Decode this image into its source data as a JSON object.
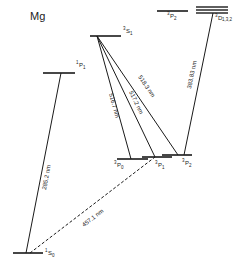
{
  "title": "Mg",
  "levels": {
    "s0_1": {
      "label": "1S0",
      "sup": "1",
      "main": "S",
      "sub": "0"
    },
    "p1_1": {
      "label": "1P1",
      "sup": "1",
      "main": "P",
      "sub": "1"
    },
    "s1_3": {
      "label": "3S1",
      "sup": "3",
      "main": "S",
      "sub": "1"
    },
    "p0_3": {
      "label": "3P0",
      "sup": "3",
      "main": "P",
      "sub": "0"
    },
    "p1_3": {
      "label": "3P1",
      "sup": "3",
      "main": "P",
      "sub": "1"
    },
    "p2_3": {
      "label": "3P2",
      "sup": "3",
      "main": "P",
      "sub": "2"
    },
    "p2_3_upper": {
      "label": "3P2",
      "sup": "3",
      "main": "P",
      "sub": "2"
    },
    "d_3": {
      "label": "3D1,3,2",
      "sup": "3",
      "main": "D",
      "sub": "1,3,2"
    }
  },
  "transitions": {
    "t285": "285.2 nm",
    "t457": "457.1 nm",
    "t516": "516.7 nm",
    "t517": "517.2 nm",
    "t518": "518.3 nm",
    "t383": "383.83 nm"
  },
  "colors": {
    "line": "#1a1a1a",
    "background": "#ffffff"
  }
}
